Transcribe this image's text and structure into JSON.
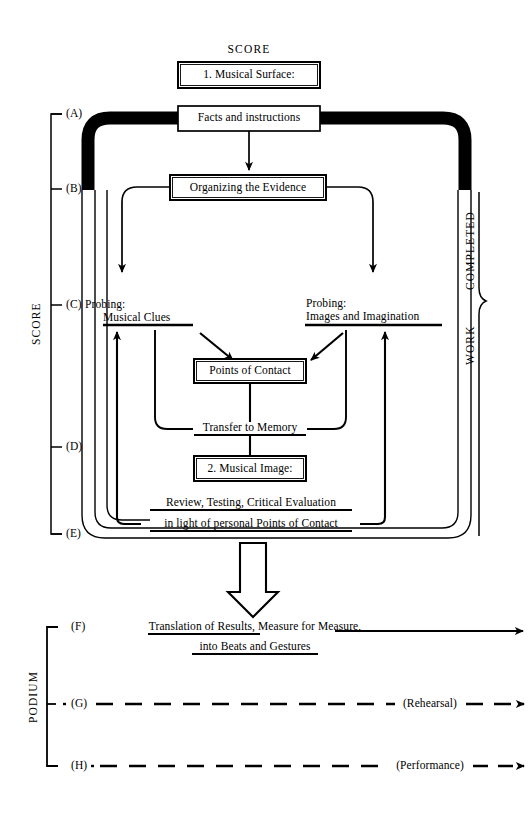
{
  "diagram": {
    "title": "SCORE",
    "top_label": "SCORE",
    "boxes": [
      {
        "id": "musical-surface",
        "label": "1. Musical Surface:"
      },
      {
        "id": "facts-instructions",
        "label": "Facts and instructions"
      },
      {
        "id": "organizing-evidence",
        "label": "Organizing the Evidence"
      },
      {
        "id": "points-of-contact",
        "label": "Points of Contact"
      },
      {
        "id": "musical-image",
        "label": "2. Musical Image:"
      }
    ],
    "underlined_nodes": [
      {
        "id": "probing-musical-clues",
        "line1": "Probing:",
        "line2": "Musical Clues"
      },
      {
        "id": "probing-images-imagination",
        "line1": "Probing:",
        "line2": "Images and Imagination"
      },
      {
        "id": "transfer-to-memory",
        "label": "Transfer to Memory"
      },
      {
        "id": "review-testing",
        "line1": "Review, Testing, Critical Evaluation",
        "line2": "in light of personal Points of Contact"
      },
      {
        "id": "translation-of-results",
        "line1": "Translation of Results, Measure for Measure,",
        "line2": "into Beats and Gestures"
      }
    ],
    "score_bracket": {
      "label": "SCORE",
      "stages": [
        "(A)",
        "(B)",
        "(C)",
        "(D)",
        "(E)"
      ]
    },
    "podium_bracket": {
      "label": "PODIUM",
      "stages": [
        "(F)",
        "(G)",
        "(H)"
      ]
    },
    "right_brace": {
      "upper_label": "COMPLETED",
      "lower_label": "WORK"
    },
    "output_lines": [
      {
        "id": "line-f",
        "stage": "(F)",
        "annotation": ""
      },
      {
        "id": "line-g",
        "stage": "(G)",
        "annotation": "(Rehearsal)"
      },
      {
        "id": "line-h",
        "stage": "(H)",
        "annotation": "(Performance)"
      }
    ],
    "colors": {
      "ink": "#000000",
      "paper": "#ffffff"
    }
  }
}
